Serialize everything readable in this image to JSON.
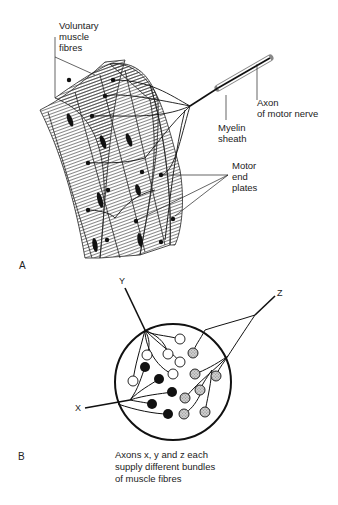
{
  "figure": {
    "panel_a": {
      "letter": "A",
      "labels": {
        "muscle_fibres": "Voluntary\nmuscle\nfibres",
        "axon": "Axon\nof motor nerve",
        "myelin": "Myelin\nsheath",
        "end_plates": "Motor\nend\nplates"
      }
    },
    "panel_b": {
      "letter": "B",
      "axon_labels": {
        "x": "X",
        "y": "Y",
        "z": "Z"
      },
      "caption": "Axons x, y and z each\nsupply different bundles\nof muscle fibres",
      "fibre_groups": [
        {
          "axon": "Y",
          "fill": "white",
          "count": 6
        },
        {
          "axon": "X",
          "fill": "black",
          "count": 5
        },
        {
          "axon": "Z",
          "fill": "stippled-grey",
          "count": 7
        }
      ]
    }
  }
}
